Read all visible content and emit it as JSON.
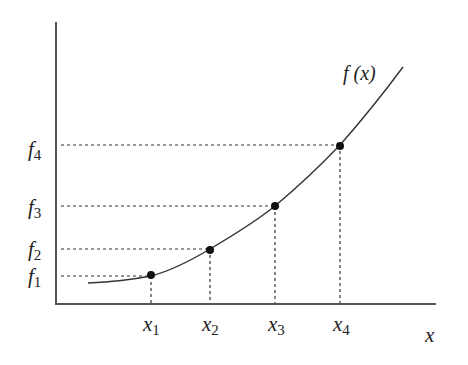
{
  "diagram": {
    "function_label": "f (x)",
    "x_axis_label": "x",
    "y_labels": [
      {
        "base": "f",
        "sub": "1"
      },
      {
        "base": "f",
        "sub": "2"
      },
      {
        "base": "f",
        "sub": "3"
      },
      {
        "base": "f",
        "sub": "4"
      }
    ],
    "x_labels": [
      {
        "base": "x",
        "sub": "1"
      },
      {
        "base": "x",
        "sub": "2"
      },
      {
        "base": "x",
        "sub": "3"
      },
      {
        "base": "x",
        "sub": "4"
      }
    ],
    "colors": {
      "line": "#333333",
      "point": "#111111",
      "axis": "#555555"
    }
  }
}
